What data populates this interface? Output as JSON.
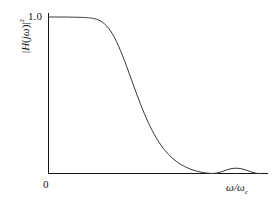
{
  "figure": {
    "background_color": "#ffffff",
    "line_color": "#38383c",
    "axis_color": "#141414",
    "y_axis_label_parts": {
      "open_bar": "|",
      "H": "H",
      "paren_open": "(",
      "j": "j",
      "omega": "ω",
      "paren_close": ")",
      "close_bar": "|",
      "exponent": "2"
    },
    "x_axis_label_parts": {
      "omega_num": "ω",
      "slash": "/",
      "omega_den": "ω",
      "subscript": "c"
    },
    "y_tick_label": "1.0",
    "origin_label": "0"
  },
  "chart_data": {
    "type": "line",
    "title": "",
    "subtitle": "",
    "xlabel": "ω/ωc",
    "ylabel": "|H(jω)|²",
    "xlim": [
      0,
      2.75
    ],
    "ylim": [
      0,
      1.08
    ],
    "grid": false,
    "legend": null,
    "xticks": [
      0
    ],
    "xticklabels": [
      "0"
    ],
    "yticks": [
      1.0
    ],
    "yticklabels": [
      "1.0"
    ],
    "annotations": [],
    "series": [
      {
        "name": "|H(jω)|^2",
        "x": [
          0.0,
          0.1,
          0.2,
          0.3,
          0.4,
          0.5,
          0.55,
          0.6,
          0.65,
          0.7,
          0.75,
          0.8,
          0.85,
          0.9,
          0.95,
          1.0,
          1.05,
          1.1,
          1.15,
          1.2,
          1.25,
          1.3,
          1.35,
          1.4,
          1.45,
          1.5,
          1.55,
          1.6,
          1.65,
          1.7,
          1.75,
          1.8,
          1.85,
          1.9,
          1.95,
          2.0,
          2.05,
          2.1,
          2.15,
          2.2,
          2.25,
          2.3,
          2.35,
          2.4,
          2.45,
          2.5,
          2.55,
          2.6,
          2.65
        ],
        "y": [
          1.0,
          1.0,
          1.0,
          0.999,
          0.998,
          0.995,
          0.992,
          0.986,
          0.975,
          0.957,
          0.93,
          0.893,
          0.845,
          0.788,
          0.724,
          0.655,
          0.584,
          0.514,
          0.447,
          0.384,
          0.326,
          0.274,
          0.228,
          0.188,
          0.153,
          0.124,
          0.099,
          0.078,
          0.06,
          0.046,
          0.034,
          0.024,
          0.016,
          0.01,
          0.005,
          0.002,
          0.0,
          0.002,
          0.008,
          0.017,
          0.026,
          0.032,
          0.034,
          0.032,
          0.026,
          0.017,
          0.008,
          0.002,
          0.0
        ]
      }
    ]
  }
}
